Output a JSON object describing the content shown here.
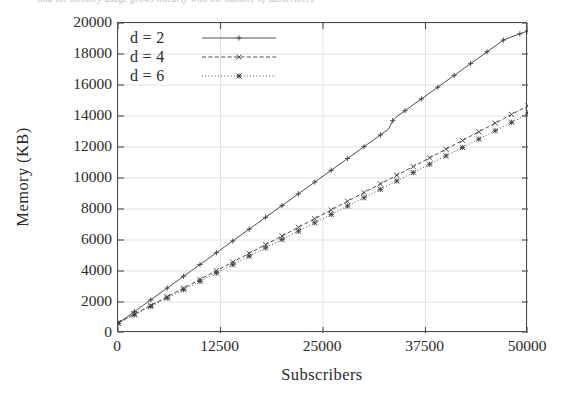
{
  "figure": {
    "top_caption_sliver": "and the memory usage grows linearly with the number of subscribers"
  },
  "chart_data": {
    "type": "line",
    "title": "",
    "xlabel": "Subscribers",
    "ylabel": "Memory (KB)",
    "xlim": [
      0,
      50000
    ],
    "ylim": [
      0,
      20000
    ],
    "xticks": [
      0,
      12500,
      25000,
      37500,
      50000
    ],
    "xticklabels": [
      "0",
      "12500",
      "25000",
      "37500",
      "50000"
    ],
    "yticks": [
      0,
      2000,
      4000,
      6000,
      8000,
      10000,
      12000,
      14000,
      16000,
      18000,
      20000
    ],
    "yticklabels": [
      "0",
      "2000",
      "4000",
      "6000",
      "8000",
      "10000",
      "12000",
      "14000",
      "16000",
      "18000",
      "20000"
    ],
    "grid": true,
    "grid_color": "#dcdcdc",
    "legend_position": "upper-left",
    "line_color": "#3a3a3a",
    "series": [
      {
        "name": "d = 2",
        "legend_label": "d = 2",
        "style": "solid",
        "marker": "plus",
        "x": [
          0,
          1000,
          2000,
          3000,
          4000,
          5000,
          6000,
          7000,
          8000,
          9000,
          10000,
          11000,
          12000,
          13000,
          14000,
          15000,
          16000,
          17000,
          18000,
          19000,
          20000,
          21000,
          22000,
          23000,
          24000,
          25000,
          26000,
          27000,
          28000,
          29000,
          30000,
          31000,
          32000,
          33000,
          33500,
          34000,
          35000,
          36000,
          37000,
          38000,
          39000,
          40000,
          41000,
          42000,
          43000,
          44000,
          45000,
          46000,
          47000,
          48000,
          49000,
          50000
        ],
        "y": [
          620,
          1000,
          1380,
          1760,
          2140,
          2520,
          2900,
          3280,
          3660,
          4040,
          4420,
          4800,
          5180,
          5560,
          5940,
          6320,
          6700,
          7080,
          7460,
          7840,
          8220,
          8600,
          8980,
          9360,
          9740,
          10120,
          10500,
          10880,
          11260,
          11640,
          12020,
          12400,
          12780,
          13160,
          13700,
          13960,
          14340,
          14720,
          15100,
          15480,
          15860,
          16240,
          16620,
          17000,
          17380,
          17760,
          18140,
          18520,
          18900,
          19100,
          19300,
          19500
        ]
      },
      {
        "name": "d = 4",
        "legend_label": "d = 4",
        "style": "dashed",
        "marker": "cross",
        "x": [
          0,
          1000,
          2000,
          3000,
          4000,
          5000,
          6000,
          7000,
          8000,
          9000,
          10000,
          11000,
          12000,
          13000,
          14000,
          15000,
          16000,
          17000,
          18000,
          19000,
          20000,
          21000,
          22000,
          23000,
          24000,
          25000,
          26000,
          27000,
          28000,
          29000,
          30000,
          31000,
          32000,
          33000,
          34000,
          35000,
          36000,
          37000,
          38000,
          39000,
          40000,
          41000,
          42000,
          43000,
          44000,
          45000,
          46000,
          47000,
          48000,
          49000,
          50000
        ],
        "y": [
          660,
          940,
          1220,
          1500,
          1780,
          2060,
          2340,
          2620,
          2900,
          3180,
          3460,
          3740,
          4020,
          4300,
          4580,
          4860,
          5140,
          5420,
          5700,
          5980,
          6260,
          6540,
          6820,
          7100,
          7380,
          7660,
          7940,
          8220,
          8500,
          8780,
          9060,
          9340,
          9620,
          9900,
          10180,
          10460,
          10740,
          11020,
          11300,
          11580,
          11860,
          12140,
          12420,
          12700,
          12980,
          13260,
          13540,
          13820,
          14100,
          14380,
          14660
        ]
      },
      {
        "name": "d = 6",
        "legend_label": "d = 6",
        "style": "dotted",
        "marker": "star",
        "x": [
          0,
          1000,
          2000,
          3000,
          4000,
          5000,
          6000,
          7000,
          8000,
          9000,
          10000,
          11000,
          12000,
          13000,
          14000,
          15000,
          16000,
          17000,
          18000,
          19000,
          20000,
          21000,
          22000,
          23000,
          24000,
          25000,
          26000,
          27000,
          28000,
          29000,
          30000,
          31000,
          32000,
          33000,
          34000,
          35000,
          36000,
          37000,
          38000,
          39000,
          40000,
          41000,
          42000,
          43000,
          44000,
          45000,
          46000,
          47000,
          48000,
          49000,
          50000
        ],
        "y": [
          640,
          900,
          1170,
          1440,
          1710,
          1980,
          2250,
          2520,
          2790,
          3060,
          3330,
          3600,
          3870,
          4140,
          4410,
          4680,
          4950,
          5220,
          5490,
          5760,
          6030,
          6300,
          6570,
          6840,
          7110,
          7380,
          7650,
          7920,
          8190,
          8460,
          8730,
          9000,
          9270,
          9540,
          9810,
          10080,
          10350,
          10620,
          10890,
          11160,
          11430,
          11700,
          11970,
          12240,
          12510,
          12780,
          13050,
          13320,
          13590,
          13860,
          14200
        ]
      }
    ]
  }
}
